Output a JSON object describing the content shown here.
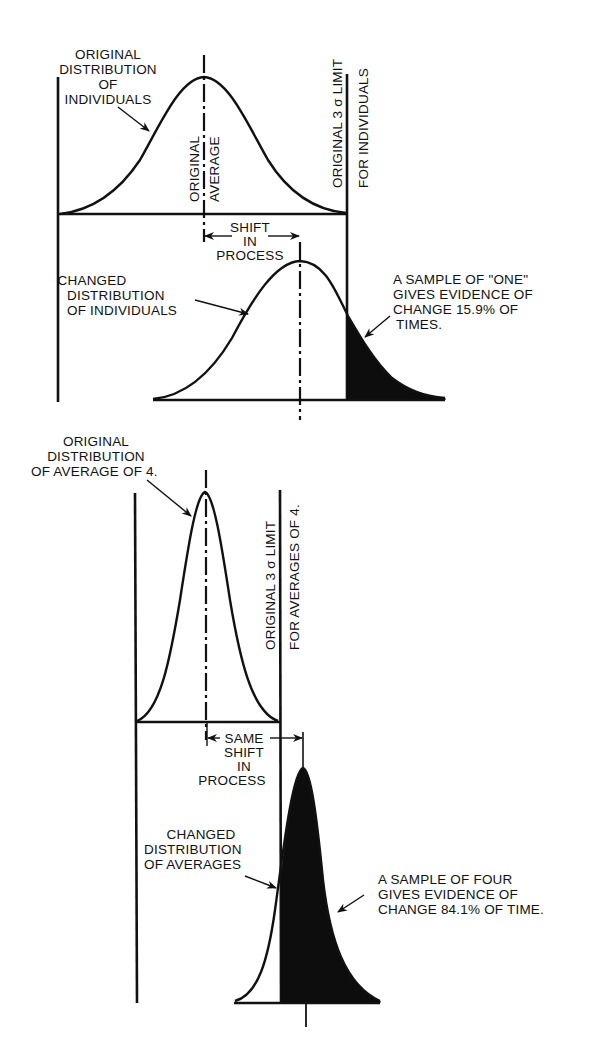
{
  "figure": {
    "top_panel": {
      "labels": {
        "original_distribution": [
          "ORIGINAL",
          "DISTRIBUTION",
          "OF",
          "INDIVIDUALS"
        ],
        "original_average": [
          "ORIGINAL",
          "AVERAGE"
        ],
        "limit": [
          "ORIGINAL 3 σ LIMIT",
          "FOR INDIVIDUALS"
        ],
        "shift": [
          "SHIFT",
          "IN",
          "PROCESS"
        ],
        "changed_distribution": [
          "CHANGED",
          "DISTRIBUTION",
          "OF INDIVIDUALS"
        ],
        "evidence": [
          "A SAMPLE OF \"ONE\"",
          "GIVES EVIDENCE OF",
          "CHANGE 15.9% OF",
          "TIMES."
        ]
      },
      "shaded_tail_percent": 15.9
    },
    "bottom_panel": {
      "labels": {
        "original_distribution": [
          "ORIGINAL",
          "DISTRIBUTION",
          "OF AVERAGE OF 4."
        ],
        "limit": [
          "ORIGINAL 3 σ LIMIT",
          "FOR AVERAGES OF 4."
        ],
        "shift": [
          "SAME",
          "SHIFT",
          "IN",
          "PROCESS"
        ],
        "changed_distribution": [
          "CHANGED",
          "DISTRIBUTION",
          "OF AVERAGES"
        ],
        "evidence": [
          "A SAMPLE OF FOUR",
          "GIVES EVIDENCE OF",
          "CHANGE 84.1% OF TIME."
        ]
      },
      "shaded_tail_percent": 84.1
    },
    "colors": {
      "ink": "#111111",
      "background": "#ffffff"
    }
  }
}
